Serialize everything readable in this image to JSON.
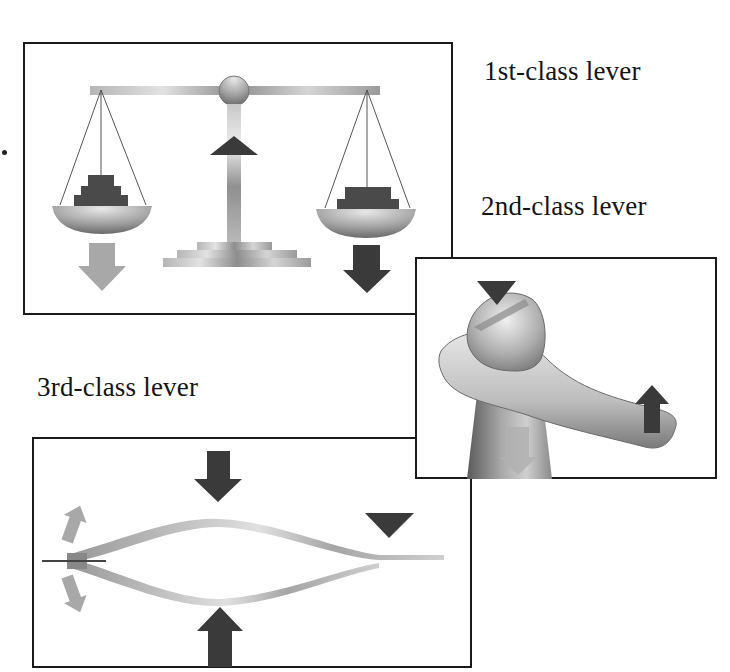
{
  "labels": {
    "first_class": "1st-class lever",
    "second_class": "2nd-class lever",
    "third_class": "3rd-class lever"
  },
  "panels": [
    {
      "id": "first-class",
      "example": "balance scale",
      "fulcrum": "center pivot",
      "arrows": [
        "effort-down-left",
        "load-down-right",
        "fulcrum-up"
      ]
    },
    {
      "id": "second-class",
      "example": "bottle opener",
      "fulcrum": "cap edge",
      "arrows": [
        "fulcrum-down",
        "load-down",
        "effort-up"
      ]
    },
    {
      "id": "third-class",
      "example": "tweezers",
      "fulcrum": "joined end",
      "arrows": [
        "effort-down",
        "effort-up",
        "load-outward",
        "fulcrum-down"
      ]
    }
  ],
  "colors": {
    "border": "#1a1a1a",
    "dark_arrow": "#3a3a3a",
    "light_arrow": "#a8a8a8",
    "metal_light": "#d8d8d8",
    "metal_mid": "#a0a0a0",
    "metal_dark": "#6a6a6a"
  }
}
